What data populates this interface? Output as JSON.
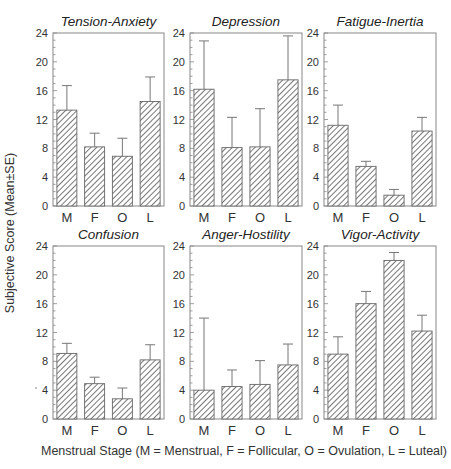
{
  "chart_data": {
    "type": "bar",
    "ylabel": "Subjective Score (Mean±SE)",
    "xlabel": "Menstrual Stage (M = Menstrual, F = Follicular, O = Ovulation, L = Luteal)",
    "categories": [
      "M",
      "F",
      "O",
      "L"
    ],
    "ylim": [
      0,
      24
    ],
    "yticks": [
      0,
      4,
      8,
      12,
      16,
      20,
      24
    ],
    "grid": false,
    "bar_pattern": "diagonal-hatch",
    "bar_color": "#555555",
    "panels": [
      {
        "title": "Tension-Anxiety",
        "values": [
          13.3,
          8.2,
          6.9,
          14.5
        ],
        "error_upper": [
          16.7,
          10.1,
          9.4,
          17.9
        ]
      },
      {
        "title": "Depression",
        "values": [
          16.2,
          8.1,
          8.2,
          17.5
        ],
        "error_upper": [
          22.9,
          12.3,
          13.5,
          23.6
        ]
      },
      {
        "title": "Fatigue-Inertia",
        "values": [
          11.2,
          5.5,
          1.5,
          10.4
        ],
        "error_upper": [
          14.0,
          6.2,
          2.3,
          12.3
        ]
      },
      {
        "title": "Confusion",
        "values": [
          9.1,
          4.9,
          2.8,
          8.2
        ],
        "error_upper": [
          10.5,
          5.8,
          4.3,
          10.3
        ]
      },
      {
        "title": "Anger-Hostility",
        "values": [
          4.0,
          4.5,
          4.8,
          7.5
        ],
        "error_upper": [
          14.0,
          6.8,
          8.1,
          10.4
        ]
      },
      {
        "title": "Vigor-Activity",
        "values": [
          9.0,
          16.0,
          22.0,
          12.2
        ],
        "error_upper": [
          11.4,
          17.7,
          23.1,
          14.4
        ]
      }
    ]
  }
}
